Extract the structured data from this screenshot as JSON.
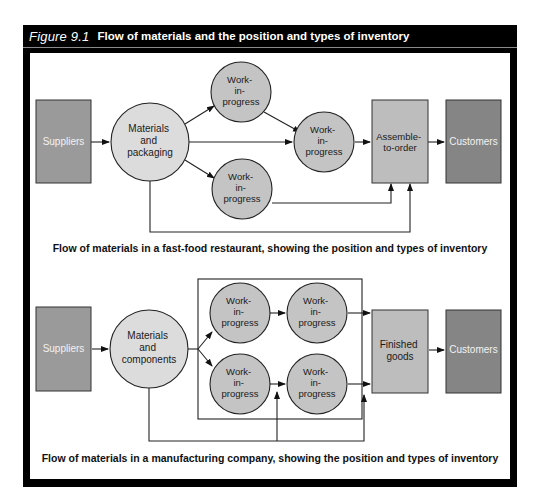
{
  "figure": {
    "number": "Figure 9.1",
    "title": "Flow of materials and the position and types of inventory"
  },
  "colors": {
    "frame": "#000000",
    "supplier_fill": "#9a9a9a",
    "customer_fill": "#858585",
    "stage_fill": "#bdbdbd",
    "wip_fill": "#c4c4c4",
    "materials_fill": "#dcdcdc",
    "line": "#222222",
    "light_text": "#f2f2f2",
    "dark_text": "#1a1a1a"
  },
  "diagram_top": {
    "caption": "Flow of materials in a fast-food restaurant, showing the position and types of inventory",
    "suppliers": "Suppliers",
    "materials": [
      "Materials",
      "and",
      "packaging"
    ],
    "wip_upper": [
      "Work-",
      "in-",
      "progress"
    ],
    "wip_middle": [
      "Work-",
      "in-",
      "progress"
    ],
    "wip_lower": [
      "Work-",
      "in-",
      "progress"
    ],
    "stage": [
      "Assemble-",
      "to-order"
    ],
    "customers": "Customers"
  },
  "diagram_bottom": {
    "caption": "Flow of materials in a manufacturing company, showing the position and types of inventory",
    "suppliers": "Suppliers",
    "materials": [
      "Materials",
      "and",
      "components"
    ],
    "wip_top_left": [
      "Work-",
      "in-",
      "progress"
    ],
    "wip_top_right": [
      "Work-",
      "in-",
      "progress"
    ],
    "wip_bottom_left": [
      "Work-",
      "in-",
      "progress"
    ],
    "wip_bottom_right": [
      "Work-",
      "in-",
      "progress"
    ],
    "stage": [
      "Finished",
      "goods"
    ],
    "customers": "Customers"
  }
}
